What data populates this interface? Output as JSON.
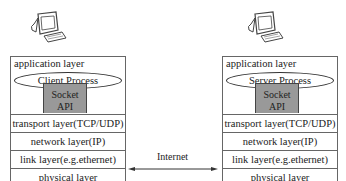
{
  "client": {
    "application_layer": "application layer",
    "process": "Client Process",
    "socket_line1": "Socket",
    "socket_line2": "API",
    "layers": [
      "transport layer(TCP/UDP)",
      "network layer(IP)",
      "link layer(e.g.ethernet)",
      "physical layer"
    ]
  },
  "server": {
    "application_layer": "application layer",
    "process": "Server Process",
    "socket_line1": "Socket",
    "socket_line2": "API",
    "layers": [
      "transport layer(TCP/UDP)",
      "network layer(IP)",
      "link layer(e.g.ethernet)",
      "physical layer"
    ]
  },
  "connection": {
    "label": "Internet"
  },
  "icons": {
    "client_computer": "computer-icon",
    "server_computer": "computer-icon"
  },
  "colors": {
    "socket_fill": "#999999",
    "border": "#666666"
  }
}
